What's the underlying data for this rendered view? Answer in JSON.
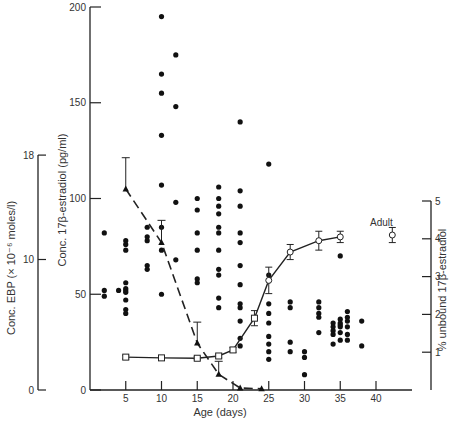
{
  "chart_data": {
    "type": "scatter",
    "title": "",
    "xlabel": "Age (days)",
    "xticks": [
      5,
      10,
      15,
      20,
      25,
      30,
      35,
      40
    ],
    "xlim": [
      0,
      42
    ],
    "axes": {
      "left_primary": {
        "label": "Conc. 17β-estradiol  (pg/ml)",
        "ticks": [
          0,
          50,
          100,
          150,
          200
        ],
        "range": [
          0,
          200
        ]
      },
      "left_secondary": {
        "label": "Conc. EBP (× 10⁻⁶ moles/l)",
        "ticks": [
          0,
          10,
          18
        ],
        "range": [
          0,
          18
        ]
      },
      "right": {
        "label": "% unbound 17β-estradiol",
        "ticks": [
          1,
          2,
          3,
          4,
          5
        ],
        "range": [
          0,
          5
        ]
      }
    },
    "series": [
      {
        "name": "17β-estradiol (individual)",
        "marker": "filled-circle",
        "axis": "left_primary",
        "points": [
          [
            2,
            82
          ],
          [
            2,
            52
          ],
          [
            2,
            49
          ],
          [
            4,
            52
          ],
          [
            5,
            78
          ],
          [
            5,
            76
          ],
          [
            5,
            73
          ],
          [
            5,
            56
          ],
          [
            5,
            53
          ],
          [
            5,
            52
          ],
          [
            5,
            51
          ],
          [
            5,
            47
          ],
          [
            5,
            42
          ],
          [
            5,
            40
          ],
          [
            8,
            85
          ],
          [
            8,
            80
          ],
          [
            8,
            78
          ],
          [
            8,
            65
          ],
          [
            8,
            63
          ],
          [
            10,
            195
          ],
          [
            10,
            165
          ],
          [
            10,
            155
          ],
          [
            10,
            133
          ],
          [
            10,
            107
          ],
          [
            10,
            85
          ],
          [
            10,
            73
          ],
          [
            10,
            50
          ],
          [
            12,
            175
          ],
          [
            12,
            148
          ],
          [
            12,
            98
          ],
          [
            12,
            68
          ],
          [
            15,
            100
          ],
          [
            15,
            94
          ],
          [
            15,
            82
          ],
          [
            15,
            73
          ],
          [
            15,
            58
          ],
          [
            15,
            56
          ],
          [
            18,
            106
          ],
          [
            18,
            100
          ],
          [
            18,
            96
          ],
          [
            18,
            92
          ],
          [
            18,
            85
          ],
          [
            18,
            82
          ],
          [
            18,
            73
          ],
          [
            18,
            63
          ],
          [
            18,
            60
          ],
          [
            18,
            48
          ],
          [
            18,
            43
          ],
          [
            21,
            140
          ],
          [
            21,
            104
          ],
          [
            21,
            96
          ],
          [
            21,
            82
          ],
          [
            21,
            77
          ],
          [
            21,
            65
          ],
          [
            21,
            55
          ],
          [
            21,
            45
          ],
          [
            21,
            43
          ],
          [
            21,
            36
          ],
          [
            21,
            27
          ],
          [
            21,
            23
          ],
          [
            25,
            118
          ],
          [
            25,
            60
          ],
          [
            25,
            57
          ],
          [
            25,
            45
          ],
          [
            25,
            40
          ],
          [
            25,
            35
          ],
          [
            25,
            28
          ],
          [
            25,
            24
          ],
          [
            25,
            20
          ],
          [
            25,
            16
          ],
          [
            28,
            46
          ],
          [
            28,
            43
          ],
          [
            28,
            25
          ],
          [
            28,
            20
          ],
          [
            30,
            20
          ],
          [
            30,
            17
          ],
          [
            30,
            8
          ],
          [
            32,
            46
          ],
          [
            32,
            43
          ],
          [
            32,
            40
          ],
          [
            32,
            38
          ],
          [
            32,
            30
          ],
          [
            34,
            35
          ],
          [
            34,
            33
          ],
          [
            34,
            31
          ],
          [
            34,
            29
          ],
          [
            34,
            24
          ],
          [
            35,
            70
          ],
          [
            35,
            37
          ],
          [
            35,
            35
          ],
          [
            35,
            34
          ],
          [
            35,
            33
          ],
          [
            35,
            30
          ],
          [
            35,
            26
          ],
          [
            36,
            41
          ],
          [
            36,
            38
          ],
          [
            36,
            36
          ],
          [
            36,
            33
          ],
          [
            36,
            29
          ],
          [
            36,
            26
          ],
          [
            38,
            36
          ],
          [
            38,
            23
          ]
        ]
      },
      {
        "name": "EBP concentration",
        "marker": "filled-triangle",
        "line": "dashed",
        "axis": "left_secondary",
        "x": [
          5,
          10,
          15,
          18,
          21,
          24
        ],
        "values": [
          15.4,
          11.3,
          3.6,
          1.2,
          0.15,
          0.1
        ],
        "error_upper": [
          17.8,
          13.0,
          5.2,
          2.2,
          null,
          null
        ]
      },
      {
        "name": "% unbound 17β-estradiol",
        "marker": "open-square/circle",
        "line": "solid",
        "axis": "right",
        "x": [
          5,
          10,
          15,
          18,
          20,
          23,
          25,
          28,
          32,
          35
        ],
        "values": [
          0.87,
          0.85,
          0.84,
          0.9,
          1.06,
          1.9,
          2.9,
          3.65,
          3.95,
          4.05
        ],
        "error": [
          0.05,
          0.05,
          0.04,
          0.05,
          0.06,
          0.2,
          0.35,
          0.2,
          0.25,
          0.15
        ]
      },
      {
        "name": "Adult",
        "marker": "open-circle",
        "axis": "right",
        "x": [
          42
        ],
        "values": [
          4.1
        ],
        "error": [
          0.2
        ]
      }
    ],
    "annotations": [
      {
        "text": "Adult",
        "x": 42,
        "y": 4.35
      }
    ],
    "grid": false,
    "legend": "none"
  },
  "labels": {
    "xlabel": "Age (days)",
    "left_primary": "Conc. 17β-estradiol  (pg/ml)",
    "left_secondary": "Conc. EBP (× 10⁻⁶ moles/l)",
    "right": "% unbound 17β-estradiol",
    "adult": "Adult"
  }
}
